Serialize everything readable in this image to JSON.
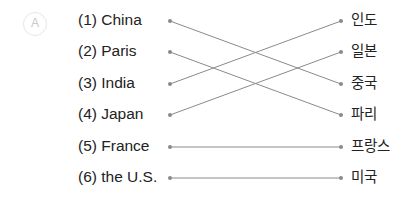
{
  "badge": "A",
  "left_items": [
    "(1) China",
    "(2) Paris",
    "(3) India",
    "(4) Japan",
    "(5) France",
    "(6) the U.S."
  ],
  "right_items": [
    "인도",
    "일본",
    "중국",
    "파리",
    "프랑스",
    "미국"
  ],
  "connections": [
    [
      0,
      2
    ],
    [
      1,
      3
    ],
    [
      2,
      0
    ],
    [
      3,
      1
    ],
    [
      4,
      4
    ],
    [
      5,
      5
    ]
  ],
  "colors": {
    "line": "#8a8a8a",
    "dot": "#8a8a8a"
  }
}
